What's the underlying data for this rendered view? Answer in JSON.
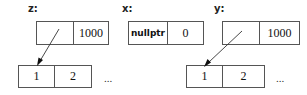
{
  "variables": [
    {
      "name": "z:",
      "cells": [
        "",
        "1000"
      ]
    },
    {
      "name": "x:",
      "cells": [
        "nullptr",
        "0"
      ]
    },
    {
      "name": "y:",
      "cells": [
        "",
        "1000"
      ]
    }
  ],
  "arrays": [
    {
      "cells": [
        "1",
        "2"
      ],
      "ellipsis": "..."
    },
    {
      "cells": [
        "1",
        "2"
      ],
      "ellipsis": "..."
    }
  ]
}
